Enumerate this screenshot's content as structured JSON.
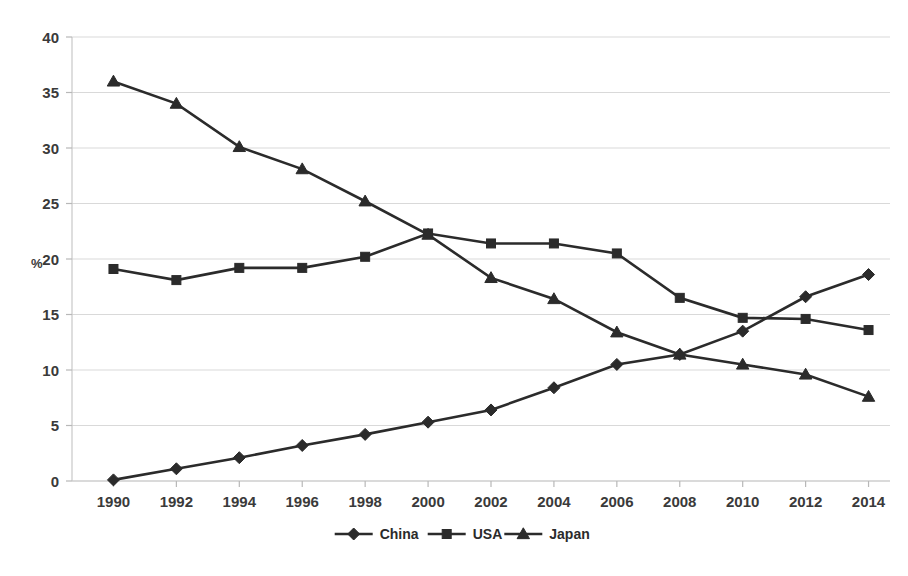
{
  "chart_data": {
    "type": "line",
    "title": "",
    "xlabel": "",
    "ylabel": "%",
    "categories": [
      "1990",
      "1992",
      "1994",
      "1996",
      "1998",
      "2000",
      "2002",
      "2004",
      "2006",
      "2008",
      "2010",
      "2012",
      "2014"
    ],
    "series": [
      {
        "name": "China",
        "marker": "diamond",
        "color": "#2b2b2b",
        "values": [
          0.1,
          1.1,
          2.1,
          3.2,
          4.2,
          5.3,
          6.4,
          8.4,
          10.5,
          11.4,
          13.5,
          16.6,
          18.6
        ]
      },
      {
        "name": "USA",
        "marker": "square",
        "color": "#2b2b2b",
        "values": [
          19.1,
          18.1,
          19.2,
          19.2,
          20.2,
          22.3,
          21.4,
          21.4,
          20.5,
          16.5,
          14.7,
          14.6,
          13.6
        ]
      },
      {
        "name": "Japan",
        "marker": "triangle",
        "color": "#2b2b2b",
        "values": [
          36.0,
          34.0,
          30.1,
          28.1,
          25.2,
          22.2,
          18.3,
          16.4,
          13.4,
          11.4,
          10.5,
          9.6,
          7.6
        ]
      }
    ],
    "ylim": [
      0,
      40
    ],
    "ytick_step": 5,
    "yticks": [
      "0",
      "5",
      "10",
      "15",
      "20",
      "25",
      "30",
      "35",
      "40"
    ],
    "grid": true,
    "grid_axis": "y",
    "legend_position": "bottom",
    "legend_entries": [
      "China",
      "USA",
      "Japan"
    ]
  },
  "axis": {
    "y_unit": "%"
  }
}
